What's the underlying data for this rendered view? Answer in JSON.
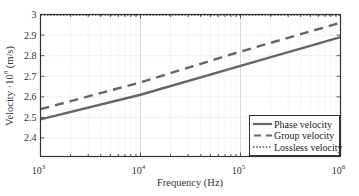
{
  "chart_data": {
    "type": "line",
    "title": "",
    "xlabel": "Frequency (Hz)",
    "ylabel": "Velocity · 10^8 (m/s)",
    "ylabel_parts": {
      "prefix": "Velocity ·10",
      "exponent": "8",
      "suffix": " (m/s)"
    },
    "xscale": "log",
    "xlim": [
      1000,
      1000000
    ],
    "ylim": [
      2.31,
      3.0
    ],
    "x_ticks": [
      {
        "value": 1000,
        "base": "10",
        "exp": "3"
      },
      {
        "value": 10000,
        "base": "10",
        "exp": "4"
      },
      {
        "value": 100000,
        "base": "10",
        "exp": "5"
      },
      {
        "value": 1000000,
        "base": "10",
        "exp": "6"
      }
    ],
    "y_ticks": [
      "2.4",
      "2.5",
      "2.6",
      "2.7",
      "2.8",
      "2.9",
      "3"
    ],
    "y_tick_values": [
      2.4,
      2.5,
      2.6,
      2.7,
      2.8,
      2.9,
      3.0
    ],
    "grid": true,
    "legend_position": "lower right",
    "x": [
      1000,
      10000,
      100000,
      1000000
    ],
    "series": [
      {
        "name": "Phase velocity",
        "style": "solid",
        "color": "#666666",
        "values": [
          2.49,
          2.61,
          2.75,
          2.89
        ]
      },
      {
        "name": "Group velocity",
        "style": "dashed",
        "color": "#666666",
        "values": [
          2.54,
          2.67,
          2.82,
          2.96
        ]
      },
      {
        "name": "Lossless velocity",
        "style": "dotted",
        "color": "#555555",
        "values": [
          2.998,
          2.998,
          2.998,
          2.998
        ]
      }
    ]
  }
}
